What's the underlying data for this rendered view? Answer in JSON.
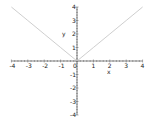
{
  "chart_data": {
    "type": "line",
    "title": "",
    "xlabel": "x",
    "ylabel": "y",
    "xlim": [
      -4,
      4
    ],
    "ylim": [
      -4,
      4
    ],
    "grid": false,
    "x_ticks": [
      "-4",
      "-3",
      "-2",
      "-1",
      "0",
      "1",
      "2",
      "3",
      "4"
    ],
    "y_ticks": [
      "4",
      "3",
      "2",
      "1",
      "-1",
      "-2",
      "-3",
      "-4"
    ],
    "series": [
      {
        "name": "y = |x|",
        "color": "#c8c8c8",
        "x": [
          -4,
          -3,
          -2,
          -1,
          0,
          1,
          2,
          3,
          4
        ],
        "y": [
          4,
          3,
          2,
          1,
          0,
          1,
          2,
          3,
          4
        ]
      }
    ]
  },
  "colors": {
    "axis": "#333333",
    "curve": "#c8c8c8"
  }
}
